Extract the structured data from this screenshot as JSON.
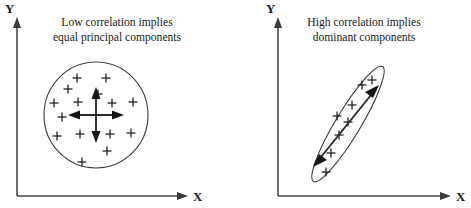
{
  "figure": {
    "background_color": "#ffffff",
    "line_color": "#3b3b3b",
    "axis_color": "#4a4a4a",
    "marker_color": "#1c1c1c",
    "width": 471,
    "height": 208
  },
  "panels": [
    {
      "id": "left",
      "caption_line1": "Low correlation implies",
      "caption_line2": "equal principal components",
      "caption_center_x": 117,
      "caption_y1": 24,
      "caption_y2": 40,
      "y_axis_label": "Y",
      "x_axis_label": "X",
      "y_label_x": 10,
      "y_label_y": 13,
      "x_label_x": 196,
      "x_label_y": 201,
      "axis": {
        "origin_x": 17,
        "origin_y": 196,
        "y_top": 24,
        "x_right": 188
      },
      "shape": {
        "type": "circle",
        "cx": 96,
        "cy": 115,
        "rx": 52,
        "ry": 53,
        "rotation": 0
      },
      "principal_components": [
        {
          "x1": 96,
          "y1": 89,
          "x2": 96,
          "y2": 141,
          "label": "vertical-component"
        },
        {
          "x1": 70,
          "y1": 115,
          "x2": 122,
          "y2": 115,
          "label": "horizontal-component"
        }
      ],
      "data_points": [
        {
          "x": 77,
          "y": 78
        },
        {
          "x": 106,
          "y": 78
        },
        {
          "x": 68,
          "y": 89
        },
        {
          "x": 98,
          "y": 94
        },
        {
          "x": 54,
          "y": 103
        },
        {
          "x": 78,
          "y": 102
        },
        {
          "x": 112,
          "y": 103
        },
        {
          "x": 133,
          "y": 102
        },
        {
          "x": 62,
          "y": 117
        },
        {
          "x": 57,
          "y": 136
        },
        {
          "x": 80,
          "y": 134
        },
        {
          "x": 110,
          "y": 134
        },
        {
          "x": 131,
          "y": 133
        },
        {
          "x": 107,
          "y": 151
        },
        {
          "x": 82,
          "y": 162
        }
      ]
    },
    {
      "id": "right",
      "caption_line1": "High correlation implies",
      "caption_line2": "dominant components",
      "caption_center_x": 364,
      "caption_y1": 24,
      "caption_y2": 40,
      "y_axis_label": "Y",
      "x_axis_label": "X",
      "y_label_x": 272,
      "y_label_y": 13,
      "x_label_x": 459,
      "x_label_y": 201,
      "axis": {
        "origin_x": 278,
        "origin_y": 196,
        "y_top": 24,
        "x_right": 451
      },
      "shape": {
        "type": "ellipse",
        "cx": 348,
        "cy": 124,
        "rx": 12,
        "ry": 67,
        "rotation": 31
      },
      "principal_components": [
        {
          "x1": 318,
          "y1": 160,
          "x2": 378,
          "y2": 88,
          "label": "dominant-component"
        }
      ],
      "data_points": [
        {
          "x": 326,
          "y": 172
        },
        {
          "x": 331,
          "y": 153
        },
        {
          "x": 339,
          "y": 135
        },
        {
          "x": 337,
          "y": 116
        },
        {
          "x": 348,
          "y": 122
        },
        {
          "x": 352,
          "y": 105
        },
        {
          "x": 362,
          "y": 85
        },
        {
          "x": 372,
          "y": 80
        }
      ]
    }
  ]
}
